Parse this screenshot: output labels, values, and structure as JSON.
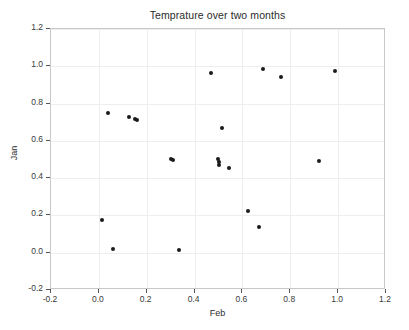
{
  "chart_data": {
    "type": "scatter",
    "title": "Temprature over two months",
    "xlabel": "Feb",
    "ylabel": "Jan",
    "xlim": [
      -0.2,
      1.2
    ],
    "ylim": [
      -0.2,
      1.2
    ],
    "grid": true,
    "legend": null,
    "xticks": [
      -0.2,
      0.0,
      0.2,
      0.4,
      0.6,
      0.8,
      1.0,
      1.2
    ],
    "xticklabels": [
      "-0.2",
      "0.0",
      "0.2",
      "0.4",
      "0.6",
      "0.8",
      "1.0",
      "1.2"
    ],
    "yticks": [
      -0.2,
      0.0,
      0.2,
      0.4,
      0.6,
      0.8,
      1.0,
      1.2
    ],
    "yticklabels": [
      "-0.2",
      "0.0",
      "0.2",
      "0.4",
      "0.6",
      "0.8",
      "1.0",
      "1.2"
    ],
    "marker": "circle",
    "marker_color": "#1a1a1a",
    "marker_size": 4,
    "points": [
      {
        "x": 0.015,
        "y": 0.178
      },
      {
        "x": 0.038,
        "y": 0.752
      },
      {
        "x": 0.058,
        "y": 0.018
      },
      {
        "x": 0.124,
        "y": 0.726
      },
      {
        "x": 0.152,
        "y": 0.716
      },
      {
        "x": 0.161,
        "y": 0.714
      },
      {
        "x": 0.3,
        "y": 0.505
      },
      {
        "x": 0.308,
        "y": 0.496
      },
      {
        "x": 0.337,
        "y": 0.014
      },
      {
        "x": 0.47,
        "y": 0.966
      },
      {
        "x": 0.497,
        "y": 0.505
      },
      {
        "x": 0.5,
        "y": 0.487
      },
      {
        "x": 0.502,
        "y": 0.472
      },
      {
        "x": 0.516,
        "y": 0.668
      },
      {
        "x": 0.545,
        "y": 0.452
      },
      {
        "x": 0.624,
        "y": 0.222
      },
      {
        "x": 0.669,
        "y": 0.137
      },
      {
        "x": 0.684,
        "y": 0.988
      },
      {
        "x": 0.762,
        "y": 0.944
      },
      {
        "x": 0.918,
        "y": 0.494
      },
      {
        "x": 0.988,
        "y": 0.977
      }
    ]
  }
}
